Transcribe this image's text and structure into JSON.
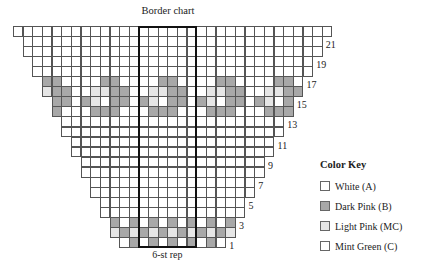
{
  "title": "Border chart",
  "repeat_label": "6-st rep",
  "color_key": {
    "title": "Color Key",
    "items": [
      {
        "code": "W",
        "label": "White (A)",
        "color": "#ffffff"
      },
      {
        "code": "D",
        "label": "Dark Pink (B)",
        "color": "#a8a8a8"
      },
      {
        "code": "L",
        "label": "Light Pink (MC)",
        "color": "#e6e6e6"
      },
      {
        "code": "M",
        "label": "Mint Green (C)",
        "color": "#ffffff"
      }
    ]
  },
  "grid": {
    "total_columns": 33,
    "total_rows": 22,
    "repeat_box_columns": [
      13,
      18
    ],
    "row_labels": [
      "1",
      "3",
      "5",
      "7",
      "9",
      "11",
      "13",
      "15",
      "17",
      "19",
      "21"
    ],
    "pattern_repeat_width": 6,
    "pattern_origin_column": 13,
    "rows": [
      {
        "row": 22,
        "pattern": [
          "W",
          "W",
          "W",
          "W",
          "W",
          "W"
        ]
      },
      {
        "row": 21,
        "pattern": [
          "W",
          "W",
          "W",
          "W",
          "W",
          "W"
        ]
      },
      {
        "row": 20,
        "pattern": [
          "W",
          "W",
          "W",
          "W",
          "W",
          "W"
        ]
      },
      {
        "row": 19,
        "pattern": [
          "W",
          "W",
          "W",
          "W",
          "W",
          "W"
        ]
      },
      {
        "row": 18,
        "pattern": [
          "W",
          "W",
          "W",
          "W",
          "W",
          "W"
        ]
      },
      {
        "row": 17,
        "pattern": [
          "W",
          "W",
          "D",
          "D",
          "W",
          "W"
        ]
      },
      {
        "row": 16,
        "pattern": [
          "W",
          "L",
          "L",
          "D",
          "D",
          "W"
        ]
      },
      {
        "row": 15,
        "pattern": [
          "D",
          "L",
          "W",
          "D",
          "D",
          "W"
        ]
      },
      {
        "row": 14,
        "pattern": [
          "W",
          "D",
          "D",
          "D",
          "W",
          "W"
        ]
      },
      {
        "row": 13,
        "pattern": [
          "W",
          "W",
          "W",
          "W",
          "W",
          "W"
        ]
      },
      {
        "row": 12,
        "pattern": [
          "W",
          "W",
          "W",
          "W",
          "W",
          "W"
        ]
      },
      {
        "row": 11,
        "pattern": [
          "W",
          "W",
          "W",
          "W",
          "W",
          "W"
        ]
      },
      {
        "row": 10,
        "pattern": [
          "W",
          "W",
          "W",
          "W",
          "W",
          "W"
        ]
      },
      {
        "row": 9,
        "pattern": [
          "W",
          "W",
          "W",
          "W",
          "W",
          "W"
        ]
      },
      {
        "row": 8,
        "pattern": [
          "W",
          "W",
          "W",
          "W",
          "W",
          "W"
        ]
      },
      {
        "row": 7,
        "pattern": [
          "W",
          "W",
          "W",
          "W",
          "W",
          "W"
        ]
      },
      {
        "row": 6,
        "pattern": [
          "W",
          "W",
          "W",
          "W",
          "W",
          "W"
        ]
      },
      {
        "row": 5,
        "pattern": [
          "W",
          "W",
          "W",
          "W",
          "W",
          "W"
        ]
      },
      {
        "row": 4,
        "pattern": [
          "W",
          "W",
          "W",
          "W",
          "W",
          "W"
        ]
      },
      {
        "row": 3,
        "pattern": [
          "W",
          "D",
          "W",
          "D",
          "W",
          "D"
        ]
      },
      {
        "row": 2,
        "pattern": [
          "D",
          "L",
          "D",
          "L",
          "D",
          "L"
        ]
      },
      {
        "row": 1,
        "pattern": [
          "W",
          "D",
          "W",
          "D",
          "W",
          "D"
        ]
      }
    ]
  }
}
